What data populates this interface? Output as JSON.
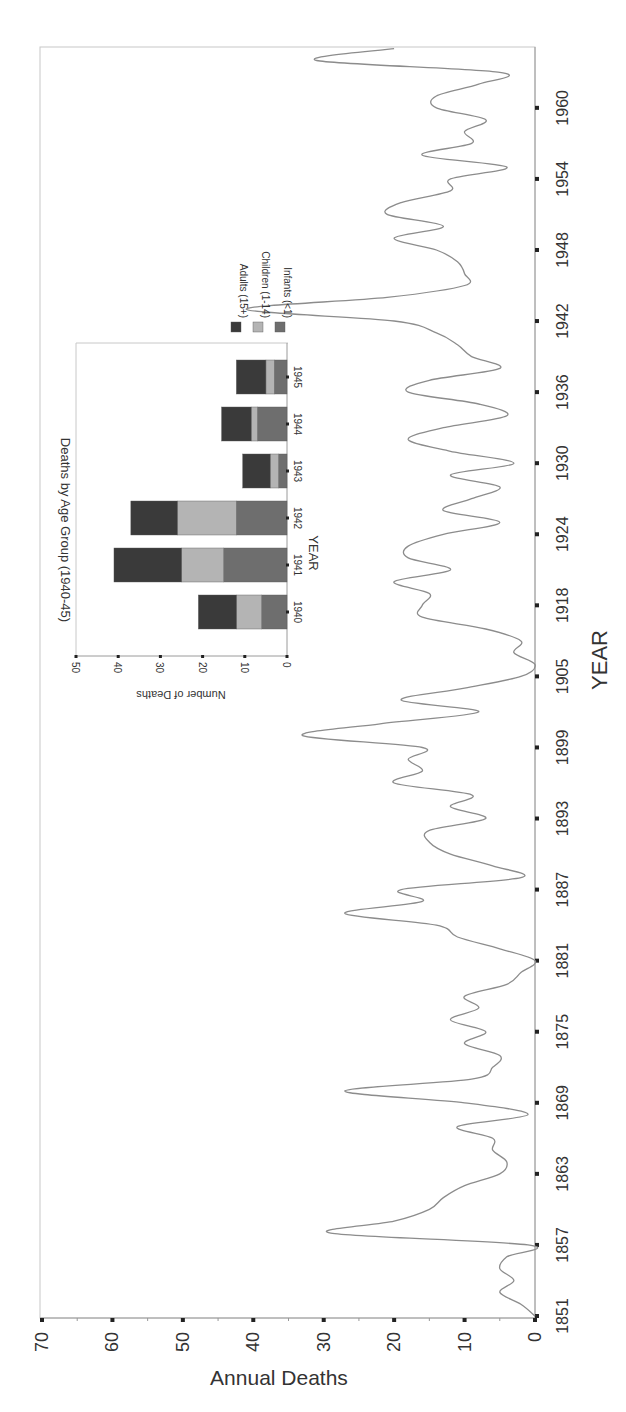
{
  "chart_data": [
    {
      "type": "line",
      "orientation": "rotated-90-ccw",
      "title": "",
      "xlabel": "YEAR",
      "ylabel": "Annual Deaths",
      "ylim": [
        0,
        70
      ],
      "yticks": [
        0,
        10,
        20,
        30,
        40,
        50,
        60,
        70
      ],
      "xtick_labels": [
        "1851",
        "1857",
        "1863",
        "1869",
        "1875",
        "1881",
        "1887",
        "1893",
        "1899",
        "1905",
        "1918",
        "1924",
        "1930",
        "1936",
        "1942",
        "1948",
        "1954",
        "1960"
      ],
      "grid": false,
      "line_color": "#8c8c8c",
      "note": "Points are evenly spaced; tick labels every 6 points (years 1906-1911 absent between 1905 and 1918 ticks)",
      "x": [
        "1851",
        "1852",
        "1853",
        "1854",
        "1855",
        "1856",
        "1857",
        "1858",
        "1859",
        "1860",
        "1861",
        "1862",
        "1863",
        "1864",
        "1865",
        "1866",
        "1867",
        "1868",
        "1869",
        "1870",
        "1871",
        "1872",
        "1873",
        "1874",
        "1875",
        "1876",
        "1877",
        "1878",
        "1879",
        "1880",
        "1881",
        "1882",
        "1883",
        "1884",
        "1885",
        "1886",
        "1887",
        "1888",
        "1889",
        "1890",
        "1891",
        "1892",
        "1893",
        "1894",
        "1895",
        "1896",
        "1897",
        "1898",
        "1899",
        "1900",
        "1901",
        "1902",
        "1903",
        "1904",
        "1905",
        "1912",
        "1913",
        "1914",
        "1915",
        "1916",
        "1917",
        "1918",
        "1919",
        "1920",
        "1921",
        "1922",
        "1923",
        "1924",
        "1925",
        "1926",
        "1927",
        "1928",
        "1929",
        "1930",
        "1931",
        "1932",
        "1933",
        "1934",
        "1935",
        "1936",
        "1937",
        "1938",
        "1939",
        "1940",
        "1941",
        "1942",
        "1943",
        "1944",
        "1945",
        "1946",
        "1947",
        "1948",
        "1949",
        "1950",
        "1951",
        "1952",
        "1953",
        "1954",
        "1955",
        "1956",
        "1957",
        "1958",
        "1959",
        "1960",
        "1961",
        "1962"
      ],
      "values": [
        0,
        2,
        5,
        3,
        5,
        4,
        1,
        29,
        20,
        15,
        13,
        10,
        5,
        4,
        6,
        6,
        11,
        1,
        10,
        27,
        9,
        6,
        5,
        10,
        7,
        12,
        8,
        10,
        4,
        2,
        0,
        5,
        11,
        14,
        27,
        16,
        19,
        2,
        6,
        12,
        15,
        15,
        7,
        12,
        9,
        20,
        16,
        18,
        16,
        33,
        22,
        8,
        19,
        10,
        2,
        0,
        3,
        2,
        7,
        16,
        16,
        15,
        20,
        12,
        18,
        18,
        13,
        5,
        13,
        9,
        5,
        12,
        3,
        12,
        18,
        13,
        4,
        8,
        18,
        15,
        5,
        9,
        11,
        14,
        20,
        41,
        21,
        10,
        10,
        11,
        14,
        20,
        13,
        21,
        19,
        12,
        12,
        4,
        16,
        9,
        10,
        7,
        14,
        14,
        8,
        5,
        31,
        20,
        17,
        15
      ],
      "series": [
        {
          "name": "Annual Deaths",
          "values_ref": "values"
        }
      ]
    },
    {
      "type": "bar",
      "stacked": true,
      "orientation": "rotated-90-cw",
      "title": "Deaths by Age Group (1940-45)",
      "xlabel": "YEAR",
      "ylabel": "Number of Deaths",
      "ylim": [
        0,
        50
      ],
      "yticks": [
        0,
        10,
        20,
        30,
        40,
        50
      ],
      "categories": [
        "1940",
        "1941",
        "1942",
        "1943",
        "1944",
        "1945"
      ],
      "legend_position": "right",
      "series": [
        {
          "name": "Infants (<1)",
          "color": "#6e6e6e",
          "values": [
            6,
            15,
            12,
            2,
            7,
            3
          ]
        },
        {
          "name": "Children (1-14)",
          "color": "#b4b4b4",
          "values": [
            6,
            10,
            14,
            2,
            1.5,
            2
          ]
        },
        {
          "name": "Adults (15+)",
          "color": "#3a3a3a",
          "values": [
            9,
            16,
            11,
            6.5,
            7,
            7
          ]
        }
      ]
    }
  ],
  "main": {
    "ylabel": "Annual Deaths",
    "xlabel": "YEAR",
    "yticks": [
      "0",
      "10",
      "20",
      "30",
      "40",
      "50",
      "60",
      "70"
    ],
    "xticks": [
      "1851",
      "1857",
      "1863",
      "1869",
      "1875",
      "1881",
      "1887",
      "1893",
      "1899",
      "1905",
      "1918",
      "1924",
      "1930",
      "1936",
      "1942",
      "1948",
      "1954",
      "1960"
    ]
  },
  "inset": {
    "title": "Deaths by Age Group (1940-45)",
    "ylabel": "Number of Deaths",
    "xlabel": "YEAR",
    "yticks": [
      "0",
      "10",
      "20",
      "30",
      "40",
      "50"
    ],
    "xticks": [
      "1940",
      "1941",
      "1942",
      "1943",
      "1944",
      "1945"
    ],
    "legend": [
      "Adults (15+)",
      "Children (1-14)",
      "Infants (<1)"
    ]
  }
}
